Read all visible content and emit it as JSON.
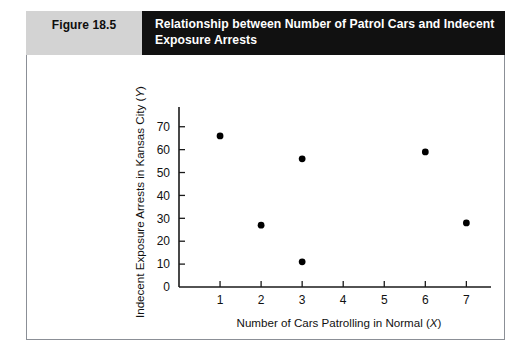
{
  "figure": {
    "number_label": "Figure 18.5",
    "title": "Relationship between Number of Patrol Cars and Indecent Exposure Arrests"
  },
  "colors": {
    "header_bar": "#111111",
    "number_box": "#d3d3d3",
    "frame_border": "#8b8f96",
    "point": "#000000",
    "axis": "#1a1a1a"
  },
  "chart_data": {
    "type": "scatter",
    "title": "Relationship between Number of Patrol Cars and Indecent Exposure Arrests",
    "xlabel": "Number of Cars Patrolling in Normal (X)",
    "ylabel": "Indecent Exposure Arrests in Kansas City (Y)",
    "xlabel_main": "Number of Cars Patrolling in Normal (",
    "xlabel_var": "X",
    "xlabel_tail": ")",
    "ylabel_main": "Indecent Exposure Arrests in Kansas City (",
    "ylabel_var": "Y",
    "ylabel_tail": ")",
    "xlim": [
      0,
      7.6
    ],
    "ylim": [
      0,
      76
    ],
    "xticks": [
      1,
      2,
      3,
      4,
      5,
      6,
      7
    ],
    "yticks": [
      0,
      10,
      20,
      30,
      40,
      50,
      60,
      70
    ],
    "xtick_labels": [
      "1",
      "2",
      "3",
      "4",
      "5",
      "6",
      "7"
    ],
    "ytick_labels": [
      "0",
      "10",
      "20",
      "30",
      "40",
      "50",
      "60",
      "70"
    ],
    "grid": false,
    "legend": false,
    "points": [
      {
        "x": 1,
        "y": 66
      },
      {
        "x": 2,
        "y": 27
      },
      {
        "x": 3,
        "y": 56
      },
      {
        "x": 3,
        "y": 11
      },
      {
        "x": 6,
        "y": 59
      },
      {
        "x": 7,
        "y": 28
      }
    ]
  }
}
